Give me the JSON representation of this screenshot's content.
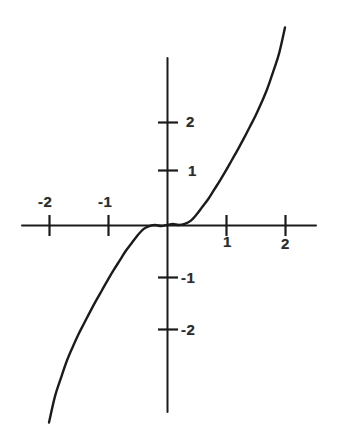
{
  "figure": {
    "kind": "scanned-hand-drawn-graph",
    "background_color": "#ffffff",
    "ink_color": "#1b1b1b",
    "width": 342,
    "height": 440
  },
  "chart_data": {
    "type": "line",
    "title": "",
    "subtitle": "",
    "xlabel": "",
    "ylabel": "",
    "xlim": [
      -2.85,
      3.0
    ],
    "ylim": [
      -2.65,
      3.55
    ],
    "grid": false,
    "legend": null,
    "axes": {
      "x_axis_label_text": "",
      "y_axis_label_text": "",
      "origin_px": [
        167,
        225
      ],
      "units_per_px_x": 59,
      "units_per_px_y": 52,
      "x_axis_line_y_px": 225,
      "y_axis_line_x_px": 167,
      "x_axis_span_px": [
        22,
        316
      ],
      "y_axis_span_px": [
        58,
        412
      ]
    },
    "x_ticks": [
      {
        "value": -2,
        "label": "-2",
        "px": 49,
        "label_side": "above"
      },
      {
        "value": -1,
        "label": "-1",
        "px": 108,
        "label_side": "above"
      },
      {
        "value": 1,
        "label": "1",
        "px": 226,
        "label_side": "below"
      },
      {
        "value": 2,
        "label": "2",
        "px": 285,
        "label_side": "below"
      }
    ],
    "y_ticks": [
      {
        "value": 2,
        "label": "2",
        "px": 122,
        "label_side": "right"
      },
      {
        "value": 1,
        "label": "1",
        "px": 170,
        "label_side": "right"
      },
      {
        "value": -1,
        "label": "-1",
        "px": 277,
        "label_side": "right"
      },
      {
        "value": -2,
        "label": "-2",
        "px": 329,
        "label_side": "right"
      }
    ],
    "series": [
      {
        "name": "curve",
        "description": "odd, monotonically increasing curve through the origin, nearly flat between about x = -0.4 and x = 0.4 with small hand-drawn wiggles, then rising steeply",
        "x": [
          -2.0,
          -1.9,
          -1.8,
          -1.7,
          -1.6,
          -1.5,
          -1.4,
          -1.3,
          -1.2,
          -1.1,
          -1.0,
          -0.9,
          -0.8,
          -0.7,
          -0.6,
          -0.5,
          -0.4,
          -0.3,
          -0.2,
          -0.1,
          0.0,
          0.1,
          0.2,
          0.3,
          0.4,
          0.5,
          0.6,
          0.7,
          0.8,
          0.9,
          1.0,
          1.1,
          1.2,
          1.3,
          1.4,
          1.5,
          1.6,
          1.7,
          1.8,
          1.9,
          2.0
        ],
        "y": [
          -3.8,
          -3.3,
          -2.95,
          -2.62,
          -2.35,
          -2.1,
          -1.88,
          -1.66,
          -1.45,
          -1.25,
          -1.05,
          -0.86,
          -0.68,
          -0.5,
          -0.35,
          -0.2,
          -0.08,
          -0.02,
          0.0,
          -0.02,
          0.0,
          0.02,
          0.0,
          0.02,
          0.08,
          0.2,
          0.35,
          0.5,
          0.68,
          0.86,
          1.05,
          1.25,
          1.45,
          1.66,
          1.88,
          2.1,
          2.35,
          2.62,
          2.95,
          3.3,
          3.8
        ],
        "color": "#1b1b1b",
        "linewidth": 2.4,
        "style": "solid"
      }
    ],
    "annotations": [
      {
        "text": "-2",
        "role": "x-tick-label",
        "at": [
          -2,
          0.28
        ]
      },
      {
        "text": "-1",
        "role": "x-tick-label",
        "at": [
          -1,
          0.28
        ]
      },
      {
        "text": "1",
        "role": "x-tick-label",
        "at": [
          1,
          -0.28
        ]
      },
      {
        "text": "2",
        "role": "x-tick-label",
        "at": [
          2,
          -0.33
        ]
      },
      {
        "text": "2",
        "role": "y-tick-label",
        "at": [
          0.33,
          2
        ]
      },
      {
        "text": "1",
        "role": "y-tick-label",
        "at": [
          0.33,
          1
        ]
      },
      {
        "text": "-1",
        "role": "y-tick-label",
        "at": [
          0.3,
          -1
        ]
      },
      {
        "text": "-2",
        "role": "y-tick-label",
        "at": [
          0.3,
          -2
        ]
      }
    ]
  },
  "labels": {
    "x_neg2": "-2",
    "x_neg1": "-1",
    "x_pos1": "1",
    "x_pos2": "2",
    "y_pos2": "2",
    "y_pos1": "1",
    "y_neg1": "-1",
    "y_neg2": "-2"
  }
}
